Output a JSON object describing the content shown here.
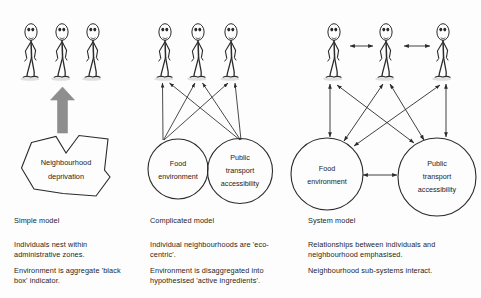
{
  "figure": {
    "background_color": "#fdfdfd",
    "ink_color": "#2b2b2b",
    "arrow_gray": "#8a8a8a"
  },
  "panels": [
    {
      "id": "simple",
      "caption_title": "Simple model",
      "caption_lines": [
        "Individuals nest within",
        "administrative zones.",
        "Environment is aggregate 'black",
        "box' indicator."
      ],
      "people_count": 3,
      "nodes": [
        {
          "label": "Neighbourhood deprivation",
          "lines": [
            "Neighbourhood",
            "deprivation"
          ],
          "shape": "polygon"
        }
      ],
      "big_arrow": {
        "name": "upward-block-arrow",
        "direction": "up",
        "color": "#8a8a8a"
      }
    },
    {
      "id": "complicated",
      "caption_title": "Complicated model",
      "caption_lines": [
        "Individual neighbourhoods are 'eco-",
        "centric'.",
        "Environment is disaggregated into",
        "hypothesised 'active ingredients'."
      ],
      "people_count": 3,
      "nodes": [
        {
          "label": "Food environment",
          "lines": [
            "Food",
            "environment"
          ],
          "shape": "circle"
        },
        {
          "label": "Public transport accessibility",
          "lines": [
            "Public",
            "transport",
            "accessibility"
          ],
          "shape": "circle"
        }
      ],
      "arrow_style": "single-headed, node to each person"
    },
    {
      "id": "system",
      "caption_title": "System model",
      "caption_lines": [
        "Relationships between individuals and",
        "neighbourhood emphasised.",
        "Neighbourhood sub-systems interact."
      ],
      "people_count": 3,
      "nodes": [
        {
          "label": "Food environment",
          "lines": [
            "Food",
            "environment"
          ],
          "shape": "circle"
        },
        {
          "label": "Public transport accessibility",
          "lines": [
            "Public",
            "transport",
            "accessibility"
          ],
          "shape": "circle"
        }
      ],
      "arrow_style": "double-headed, person-person, node-person and node-node"
    }
  ]
}
